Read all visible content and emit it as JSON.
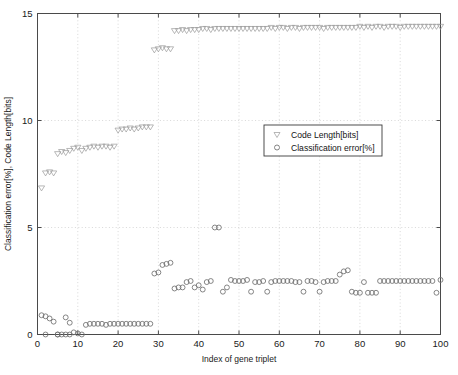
{
  "figure": {
    "title_fragment": "",
    "background": "#ffffff",
    "frame_color": "#4a4a4a",
    "grid_color": "#bdbdbd"
  },
  "legend": {
    "position": "center-right",
    "entries": [
      {
        "label": "Code Length[bits]",
        "marker": "triangle-down-marker",
        "color": "#9a9a9a"
      },
      {
        "label": "Classification error[%]",
        "marker": "circle-marker",
        "color": "#6f6f6f"
      }
    ]
  },
  "chart_data": {
    "type": "scatter",
    "title": "",
    "xlabel": "Index of gene triplet",
    "ylabel": "Classification error[%], Code Length[bits]",
    "xlim": [
      0,
      100
    ],
    "ylim": [
      0,
      15
    ],
    "xticks": [
      0,
      10,
      20,
      30,
      40,
      50,
      60,
      70,
      80,
      90,
      100
    ],
    "yticks": [
      0,
      5,
      10,
      15
    ],
    "grid": true,
    "grid_style": "dotted",
    "legend_position": "center-right",
    "series": [
      {
        "name": "Code Length[bits]",
        "marker": "triangle-down",
        "color": "#9a9a9a",
        "x": [
          1,
          2,
          3,
          4,
          5,
          6,
          7,
          8,
          9,
          10,
          11,
          12,
          13,
          14,
          15,
          16,
          17,
          18,
          19,
          20,
          21,
          22,
          23,
          24,
          25,
          26,
          27,
          28,
          29,
          30,
          31,
          32,
          33,
          34,
          35,
          36,
          37,
          38,
          39,
          40,
          41,
          42,
          43,
          44,
          45,
          46,
          47,
          48,
          49,
          50,
          51,
          52,
          53,
          54,
          55,
          56,
          57,
          58,
          59,
          60,
          61,
          62,
          63,
          64,
          65,
          66,
          67,
          68,
          69,
          70,
          71,
          72,
          73,
          74,
          75,
          76,
          77,
          78,
          79,
          80,
          81,
          82,
          83,
          84,
          85,
          86,
          87,
          88,
          89,
          90,
          91,
          92,
          93,
          94,
          95,
          96,
          97,
          98,
          99,
          100
        ],
        "y": [
          6.85,
          7.55,
          7.6,
          7.55,
          8.45,
          8.55,
          8.5,
          8.6,
          8.7,
          8.75,
          8.6,
          8.7,
          8.75,
          8.8,
          8.75,
          8.8,
          8.8,
          8.75,
          8.8,
          9.55,
          9.6,
          9.6,
          9.65,
          9.6,
          9.65,
          9.7,
          9.7,
          9.7,
          13.3,
          13.35,
          13.4,
          13.35,
          13.35,
          14.2,
          14.2,
          14.25,
          14.2,
          14.25,
          14.25,
          14.25,
          14.3,
          14.3,
          14.25,
          14.3,
          14.3,
          14.3,
          14.3,
          14.3,
          14.3,
          14.3,
          14.3,
          14.3,
          14.3,
          14.3,
          14.3,
          14.3,
          14.3,
          14.35,
          14.3,
          14.35,
          14.35,
          14.3,
          14.35,
          14.35,
          14.3,
          14.35,
          14.35,
          14.35,
          14.35,
          14.35,
          14.3,
          14.35,
          14.35,
          14.35,
          14.35,
          14.35,
          14.35,
          14.35,
          14.35,
          14.4,
          14.35,
          14.4,
          14.35,
          14.4,
          14.4,
          14.35,
          14.4,
          14.4,
          14.4,
          14.35,
          14.4,
          14.4,
          14.4,
          14.4,
          14.4,
          14.4,
          14.4,
          14.4,
          14.4,
          14.4
        ]
      },
      {
        "name": "Classification error[%]",
        "marker": "circle",
        "color": "#6f6f6f",
        "x": [
          1,
          2,
          2,
          3,
          4,
          5,
          5,
          6,
          7,
          7,
          8,
          8,
          9,
          10,
          11,
          12,
          13,
          14,
          15,
          16,
          17,
          18,
          19,
          20,
          21,
          22,
          23,
          24,
          25,
          26,
          27,
          28,
          29,
          30,
          31,
          32,
          33,
          34,
          35,
          36,
          37,
          38,
          39,
          40,
          41,
          42,
          43,
          44,
          45,
          46,
          47,
          48,
          49,
          50,
          51,
          52,
          53,
          54,
          55,
          56,
          57,
          58,
          59,
          60,
          61,
          62,
          63,
          64,
          65,
          66,
          67,
          68,
          69,
          70,
          71,
          72,
          73,
          74,
          75,
          76,
          77,
          78,
          79,
          80,
          81,
          82,
          83,
          84,
          85,
          86,
          87,
          88,
          89,
          90,
          91,
          92,
          93,
          94,
          95,
          96,
          97,
          98,
          99,
          100
        ],
        "y": [
          0.9,
          0.85,
          0.0,
          0.75,
          0.6,
          0.0,
          0.0,
          0.0,
          0.8,
          0.0,
          0.55,
          0.0,
          0.1,
          0.05,
          0.0,
          0.45,
          0.5,
          0.5,
          0.5,
          0.5,
          0.45,
          0.5,
          0.5,
          0.5,
          0.5,
          0.5,
          0.5,
          0.5,
          0.5,
          0.5,
          0.5,
          0.5,
          2.85,
          2.9,
          3.25,
          3.3,
          3.35,
          2.15,
          2.2,
          2.2,
          2.45,
          2.5,
          2.2,
          2.3,
          2.1,
          2.45,
          2.5,
          5.0,
          5.0,
          2.0,
          2.2,
          2.55,
          2.5,
          2.5,
          2.5,
          2.55,
          2.0,
          2.45,
          2.45,
          2.5,
          2.0,
          2.45,
          2.5,
          2.5,
          2.5,
          2.5,
          2.5,
          2.45,
          2.45,
          2.0,
          2.5,
          2.5,
          2.45,
          2.0,
          2.45,
          2.5,
          2.5,
          2.5,
          2.8,
          2.95,
          3.0,
          2.0,
          1.95,
          1.95,
          2.45,
          1.95,
          1.95,
          1.95,
          2.5,
          2.5,
          2.5,
          2.5,
          2.5,
          2.5,
          2.5,
          2.5,
          2.5,
          2.5,
          2.5,
          2.5,
          2.5,
          2.5,
          1.95,
          2.55
        ]
      }
    ]
  }
}
